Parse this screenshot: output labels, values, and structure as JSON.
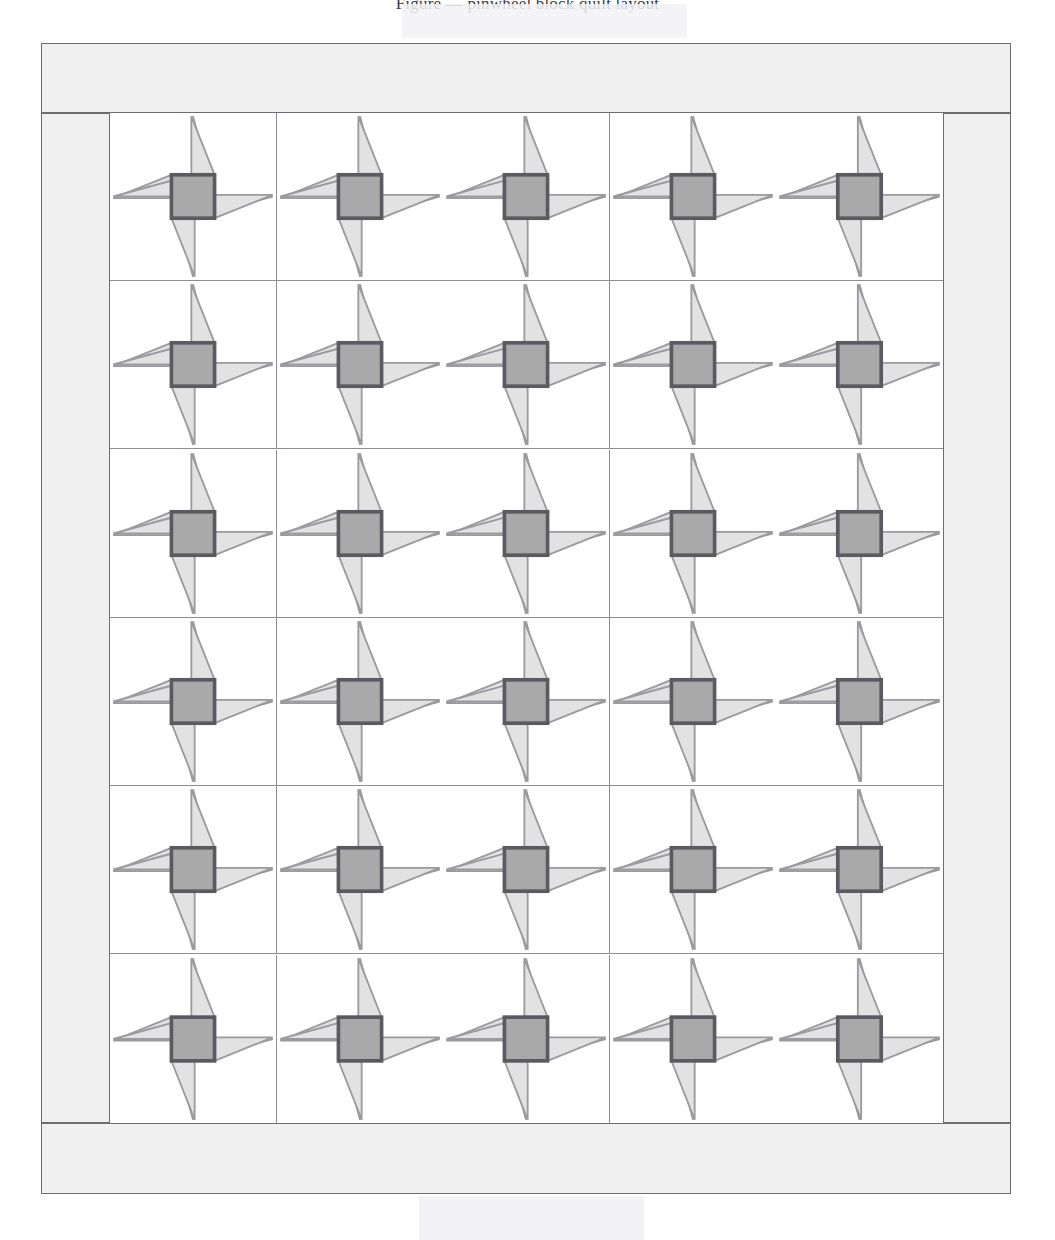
{
  "page": {
    "caption_partial": "Figure — pinwheel block quilt layout",
    "background_color": "#ffffff"
  },
  "artifacts": {
    "top_watermark": {
      "name": "scan-watermark-top",
      "color": "#f2f2f4"
    },
    "bottom_watermark": {
      "name": "scan-watermark-bottom",
      "color": "#f1f1f3"
    }
  },
  "quilt": {
    "title": "Pinwheel Quilt Diagram",
    "frame": {
      "x": 41,
      "y": 43,
      "width": 970,
      "height": 1151
    },
    "border_color": "#6c6c72",
    "border_fill": "#f0f0f0",
    "bands": {
      "top": {
        "label": "top-border-band",
        "x": 41,
        "y": 43,
        "width": 970,
        "height": 70
      },
      "bottom": {
        "label": "bottom-border-band",
        "x": 41,
        "y": 1123,
        "width": 970,
        "height": 71
      },
      "left": {
        "label": "left-border-band",
        "x": 41,
        "y": 113,
        "width": 69,
        "height": 1010
      },
      "right": {
        "label": "right-border-band",
        "x": 943,
        "y": 113,
        "width": 68,
        "height": 1010
      }
    },
    "grid": {
      "x": 110,
      "y": 113,
      "width": 833,
      "height": 1010,
      "columns": 5,
      "rows": 6,
      "block_width": 166.6,
      "block_height": 168.33,
      "sash_color": "#8d8d93"
    },
    "block": {
      "name": "pinwheel-block",
      "background": "#ffffff",
      "blade_fill": "#e2e2e2",
      "blade_stroke": "#9a9a9f",
      "hub_fill": "#a9a9a9",
      "hub_stroke": "#5a5a60",
      "blade_count": 4,
      "rotation": "counterclockwise",
      "hub_shape": "square"
    }
  },
  "chart_data": {
    "type": "table",
    "xlabel": "Column",
    "ylabel": "Row",
    "columns": [
      "Col 1",
      "Col 2",
      "Col 3",
      "Col 4",
      "Col 5"
    ],
    "rows": [
      "Row 1",
      "Row 2",
      "Row 3",
      "Row 4",
      "Row 5",
      "Row 6"
    ],
    "cell_value": "pinwheel",
    "total_blocks": 30,
    "legend": [
      {
        "name": "Blade (light fabric)",
        "color": "#e2e2e2"
      },
      {
        "name": "Center square (medium fabric)",
        "color": "#a9a9a9"
      },
      {
        "name": "Background (white fabric)",
        "color": "#ffffff"
      },
      {
        "name": "Border / sashing (light gray fabric)",
        "color": "#f0f0f0"
      }
    ]
  }
}
